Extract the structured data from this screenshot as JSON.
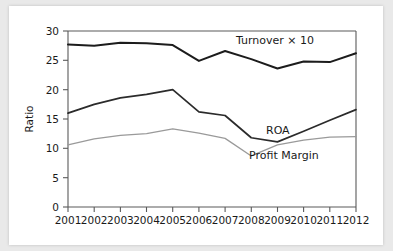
{
  "chart_data": {
    "type": "line",
    "title": "",
    "xlabel": "",
    "ylabel": "Ratio",
    "categories": [
      "2001",
      "2002",
      "2003",
      "2004",
      "2005",
      "2006",
      "2007",
      "2008",
      "2009",
      "2010",
      "2011",
      "2012"
    ],
    "xlim": [
      2001,
      2012
    ],
    "ylim": [
      0,
      30
    ],
    "yticks": [
      0,
      5,
      10,
      15,
      20,
      25,
      30
    ],
    "ytick_labels": [
      "0",
      "5",
      "10",
      "15",
      "20",
      "25",
      "30"
    ],
    "grid": false,
    "legend_position": "inline-annotations",
    "series": [
      {
        "name": "Turnover × 10",
        "color": "#1c1c1c",
        "values": [
          27.7,
          27.5,
          28.0,
          27.9,
          27.6,
          24.9,
          26.6,
          25.2,
          23.6,
          24.8,
          24.7,
          26.2
        ]
      },
      {
        "name": "ROA",
        "color": "#2b2b2b",
        "values": [
          16.0,
          17.5,
          18.6,
          19.2,
          20.0,
          16.2,
          15.6,
          11.8,
          11.1,
          12.9,
          14.8,
          16.6
        ]
      },
      {
        "name": "Profit Margin",
        "color": "#9a9a9a",
        "values": [
          10.6,
          11.6,
          12.2,
          12.5,
          13.3,
          12.6,
          11.7,
          8.7,
          10.6,
          11.4,
          11.9,
          12.0
        ]
      }
    ],
    "annotations": [
      {
        "text": "Turnover × 10",
        "x": 2007.2,
        "y": 28.4
      },
      {
        "text": "ROA",
        "x": 2008.9,
        "y": 13.8
      },
      {
        "text": "Profit Margin",
        "x": 2009.4,
        "y": 9.2
      }
    ]
  },
  "axis": {
    "y_title": "Ratio",
    "y_tick_0": "0",
    "y_tick_5": "5",
    "y_tick_10": "10",
    "y_tick_15": "15",
    "y_tick_20": "20",
    "y_tick_25": "25",
    "y_tick_30": "30",
    "x_tick_2001": "2001",
    "x_tick_2002": "2002",
    "x_tick_2003": "2003",
    "x_tick_2004": "2004",
    "x_tick_2005": "2005",
    "x_tick_2006": "2006",
    "x_tick_2007": "2007",
    "x_tick_2008": "2008",
    "x_tick_2009": "2009",
    "x_tick_2010": "2010",
    "x_tick_2011": "2011",
    "x_tick_2012": "2012"
  },
  "labels": {
    "turnover": "Turnover × 10",
    "roa": "ROA",
    "profit_margin": "Profit Margin"
  },
  "colors": {
    "background": "#e9e9e9",
    "card": "#ffffff",
    "axis": "#5a5a5a",
    "turnover": "#1c1c1c",
    "roa": "#2b2b2b",
    "profit_margin": "#9a9a9a"
  }
}
